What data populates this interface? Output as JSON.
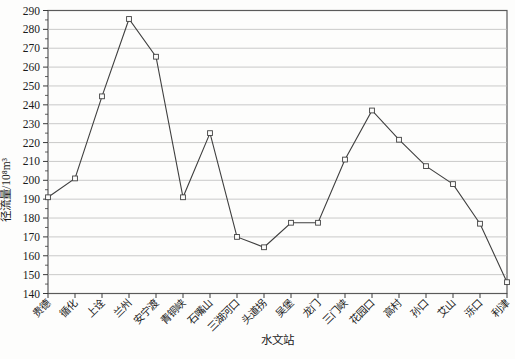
{
  "page": {
    "background_color": "#fdfdfc"
  },
  "chart_data": {
    "type": "line",
    "title": "",
    "xlabel": "水文站",
    "ylabel": "径流量/10⁸m³",
    "categories": [
      "贵德",
      "循化",
      "上诠",
      "兰州",
      "安宁渡",
      "青铜峡",
      "石嘴山",
      "三湖河口",
      "头道拐",
      "吴堡",
      "龙门",
      "三门峡",
      "花园口",
      "高村",
      "孙口",
      "艾山",
      "泺口",
      "利津"
    ],
    "series": [
      {
        "name": "径流量",
        "values": [
          191,
          201,
          244.5,
          285.5,
          265.5,
          191,
          225,
          170,
          164.5,
          177.5,
          177.5,
          211,
          237,
          221.5,
          207.5,
          198,
          177,
          146
        ]
      }
    ],
    "ylim": [
      140,
      290
    ],
    "ytick_step": 10,
    "ytick_minor_step": 5,
    "grid": true,
    "legend": false,
    "marker": "open-square",
    "line_color": "#3f3f3f",
    "marker_fill": "#fdfdfc",
    "grid_color": "#bdbdbd",
    "frame_color": "#5a5a5a",
    "tick_color": "#3a3a3a",
    "text_color": "#1a1a1a",
    "plot_background": "#fdfdfc"
  }
}
